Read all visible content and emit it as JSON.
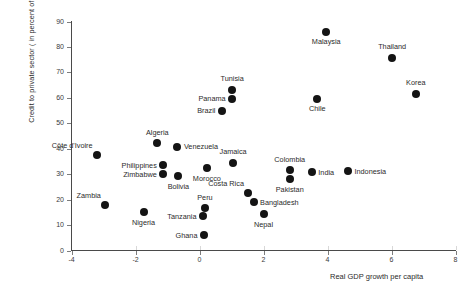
{
  "chart_data": {
    "type": "scatter",
    "title": "",
    "xlabel": "Real GDP growth per capita",
    "ylabel": "Credit to private sector ( in percent of GDP)",
    "xlim": [
      -4,
      8
    ],
    "ylim": [
      0,
      90
    ],
    "xticks": [
      "-4",
      "-2",
      "0",
      "2",
      "4",
      "6",
      "8"
    ],
    "xtick_values": [
      -4,
      -2,
      0,
      2,
      4,
      6,
      8
    ],
    "yticks": [
      "0",
      "10",
      "20",
      "30",
      "40",
      "50",
      "60",
      "70",
      "80",
      "90"
    ],
    "ytick_values": [
      0,
      10,
      20,
      30,
      40,
      50,
      60,
      70,
      80,
      90
    ],
    "grid": false,
    "legend": "none",
    "marker": "filled-circle",
    "marker_color": "#141414",
    "points": [
      {
        "label": "Malaysia",
        "x": 3.96,
        "y": 86.0,
        "label_pos": "below"
      },
      {
        "label": "Thailand",
        "x": 6.02,
        "y": 75.8,
        "label_pos": "above"
      },
      {
        "label": "Korea",
        "x": 6.76,
        "y": 61.6,
        "label_pos": "above"
      },
      {
        "label": "Tunisia",
        "x": 1.02,
        "y": 63.2,
        "label_pos": "above"
      },
      {
        "label": "Panama",
        "x": 1.02,
        "y": 59.6,
        "label_pos": "left"
      },
      {
        "label": "Chile",
        "x": 3.68,
        "y": 59.6,
        "label_pos": "below"
      },
      {
        "label": "Brazil",
        "x": 0.7,
        "y": 54.9,
        "label_pos": "left"
      },
      {
        "label": "Algeria",
        "x": -1.32,
        "y": 42.2,
        "label_pos": "above"
      },
      {
        "label": "Venezuela",
        "x": -0.69,
        "y": 40.7,
        "label_pos": "right"
      },
      {
        "label": "Côte d'Ivoire",
        "x": -3.2,
        "y": 37.5,
        "label_pos": "above-left"
      },
      {
        "label": "Jamaica",
        "x": 1.05,
        "y": 34.4,
        "label_pos": "above"
      },
      {
        "label": "Philippines",
        "x": -1.13,
        "y": 33.6,
        "label_pos": "left"
      },
      {
        "label": "Zimbabwe",
        "x": -1.13,
        "y": 30.0,
        "label_pos": "left"
      },
      {
        "label": "Colombia",
        "x": 2.82,
        "y": 31.6,
        "label_pos": "above"
      },
      {
        "label": "Morocco",
        "x": 0.23,
        "y": 32.4,
        "label_pos": "below"
      },
      {
        "label": "Bolivia",
        "x": -0.66,
        "y": 29.2,
        "label_pos": "below"
      },
      {
        "label": "Pakistan",
        "x": 2.82,
        "y": 28.0,
        "label_pos": "below"
      },
      {
        "label": "India",
        "x": 3.51,
        "y": 30.8,
        "label_pos": "right"
      },
      {
        "label": "Indonesia",
        "x": 4.64,
        "y": 31.2,
        "label_pos": "right"
      },
      {
        "label": "Costa Rica",
        "x": 1.53,
        "y": 22.5,
        "label_pos": "above-left"
      },
      {
        "label": "Bangladesh",
        "x": 1.69,
        "y": 19.0,
        "label_pos": "right"
      },
      {
        "label": "Nepal",
        "x": 2.0,
        "y": 14.2,
        "label_pos": "below"
      },
      {
        "label": "Zambia",
        "x": -2.94,
        "y": 17.8,
        "label_pos": "above-left"
      },
      {
        "label": "Nigeria",
        "x": -1.75,
        "y": 15.0,
        "label_pos": "below"
      },
      {
        "label": "Peru",
        "x": 0.17,
        "y": 16.6,
        "label_pos": "above"
      },
      {
        "label": "Tanzania",
        "x": 0.11,
        "y": 13.4,
        "label_pos": "left"
      },
      {
        "label": "Ghana",
        "x": 0.14,
        "y": 5.9,
        "label_pos": "left"
      }
    ]
  }
}
